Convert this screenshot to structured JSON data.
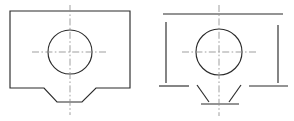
{
  "drawing": {
    "title": "Orthographic views of dovetail block with central through-hole",
    "sheet": {
      "width": 294,
      "height": 121,
      "background_color": "#ffffff"
    },
    "line_colors": {
      "object_line": "#2b2b2b",
      "center_line": "#8f8f8f"
    },
    "views": [
      {
        "id": "left-view",
        "name": "front-view-continuous",
        "style": "continuous-outline",
        "outline_points": "10,11 130,11 130,88 96,88 82,102 57,102 44,88 10,88",
        "hole": {
          "cx": 70,
          "cy": 52,
          "r": 22
        },
        "center_horizontal": {
          "x1": 32,
          "y1": 52,
          "x2": 108,
          "y2": 52
        },
        "center_vertical": {
          "x1": 70,
          "y1": 5,
          "x2": 70,
          "y2": 115
        }
      },
      {
        "id": "right-view",
        "name": "front-view-broken",
        "style": "broken-segment-outline",
        "segments": [
          {
            "id": "top-edge",
            "x1": 163,
            "y1": 14,
            "x2": 283,
            "y2": 14
          },
          {
            "id": "left-edge",
            "x1": 166,
            "y1": 22,
            "x2": 166,
            "y2": 83
          },
          {
            "id": "right-edge",
            "x1": 278,
            "y1": 25,
            "x2": 278,
            "y2": 83
          },
          {
            "id": "bottom-left-flat",
            "x1": 159,
            "y1": 86,
            "x2": 189,
            "y2": 86
          },
          {
            "id": "bottom-right-flat",
            "x1": 249,
            "y1": 86,
            "x2": 288,
            "y2": 86
          },
          {
            "id": "dovetail-left-angle",
            "x1": 197,
            "y1": 85,
            "x2": 209,
            "y2": 102
          },
          {
            "id": "dovetail-right-angle",
            "x1": 241,
            "y1": 85,
            "x2": 229,
            "y2": 102
          },
          {
            "id": "bottom-edge",
            "x1": 201,
            "y1": 104,
            "x2": 239,
            "y2": 104
          }
        ],
        "hole": {
          "cx": 219,
          "cy": 52,
          "r": 23
        },
        "center_horizontal": {
          "x1": 182,
          "y1": 52,
          "x2": 257,
          "y2": 52
        },
        "center_vertical": {
          "x1": 219,
          "y1": 5,
          "x2": 219,
          "y2": 116
        }
      }
    ]
  }
}
